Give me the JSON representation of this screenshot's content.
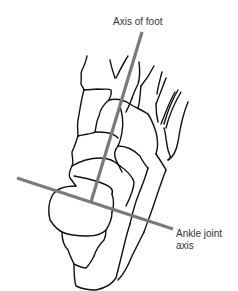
{
  "figure": {
    "type": "anatomical line diagram",
    "labels": {
      "axis_of_foot": "Axis of foot",
      "ankle_joint_axis_line1": "Ankle joint",
      "ankle_joint_axis_line2": "axis"
    },
    "colors": {
      "bone_outline": "#111111",
      "axis_line": "#7a7a7a",
      "label_text": "#333333",
      "background": "#ffffff"
    }
  }
}
